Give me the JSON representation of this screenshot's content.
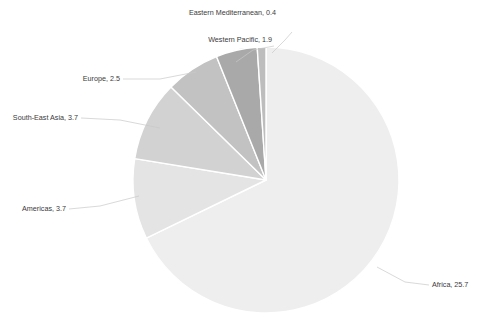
{
  "chart_data": {
    "type": "pie",
    "title": "",
    "subtitle": "",
    "xlabel": "",
    "ylabel": "",
    "legend_position": "none",
    "grid": false,
    "label_format": "name, value",
    "start_angle_deg": 0,
    "direction": "clockwise",
    "total": 37.9,
    "categories": [
      "Africa",
      "Americas",
      "South-East Asia",
      "Europe",
      "Western Pacific",
      "Eastern Mediterranean"
    ],
    "values": [
      25.7,
      3.7,
      3.7,
      2.5,
      1.9,
      0.4
    ],
    "slices": [
      {
        "name": "Africa",
        "value": 25.7,
        "label": "Africa, 25.7",
        "color": "#eeeeee",
        "label_x": 432,
        "label_y": 287,
        "label_anchor": "start"
      },
      {
        "name": "Americas",
        "value": 3.7,
        "label": "Americas, 3.7",
        "color": "#e4e4e4",
        "label_x": 66,
        "label_y": 211,
        "label_anchor": "end"
      },
      {
        "name": "South-East Asia",
        "value": 3.7,
        "label": "South-East Asia, 3.7",
        "color": "#d2d2d2",
        "label_x": 78,
        "label_y": 120,
        "label_anchor": "end"
      },
      {
        "name": "Europe",
        "value": 2.5,
        "label": "Europe, 2.5",
        "color": "#c2c2c2",
        "label_x": 120,
        "label_y": 81,
        "label_anchor": "end"
      },
      {
        "name": "Western Pacific",
        "value": 1.9,
        "label": "Western Pacific, 1.9",
        "color": "#a9a9a9",
        "label_x": 272,
        "label_y": 42,
        "label_anchor": "end"
      },
      {
        "name": "Eastern Mediterranean",
        "value": 0.4,
        "label": "Eastern Mediterranean, 0.4",
        "color": "#bdbdbd",
        "label_x": 276,
        "label_y": 15,
        "label_anchor": "end"
      }
    ],
    "geometry": {
      "center_x": 266,
      "center_y": 180,
      "radius": 133
    },
    "style": {
      "background": "#ffffff",
      "slice_border": "#ffffff",
      "leader_line": "#c8c8c8",
      "label_text": "#3a3a3a"
    }
  }
}
